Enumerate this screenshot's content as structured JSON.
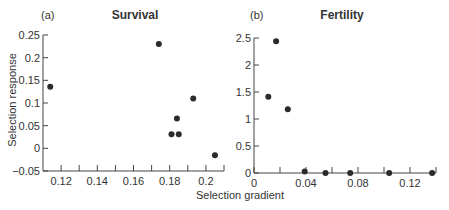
{
  "figure": {
    "ylabel": "Selection response",
    "xlabel": "Selection gradient",
    "marker_color": "#2b2b2b",
    "axis_color": "#444444"
  },
  "chart_data": [
    {
      "type": "scatter",
      "panel": "(a)",
      "title": "Survival",
      "xlabel": "Selection gradient",
      "ylabel": "Selection response",
      "xlim": [
        0.11,
        0.21
      ],
      "ylim": [
        -0.05,
        0.25
      ],
      "xticks": [
        0.12,
        0.13,
        0.14,
        0.15,
        0.16,
        0.17,
        0.18,
        0.19,
        0.2,
        0.21
      ],
      "xtick_labels": [
        "0.12",
        "",
        "0.14",
        "",
        "0.16",
        "",
        "0.18",
        "",
        "0.2",
        ""
      ],
      "yticks": [
        -0.05,
        0,
        0.05,
        0.1,
        0.15,
        0.2,
        0.25
      ],
      "ytick_labels": [
        "−0.05",
        "0",
        "0.05",
        "0.1",
        "0.15",
        "0.2",
        "0.25"
      ],
      "grid": false,
      "points": [
        {
          "x": 0.114,
          "y": 0.136
        },
        {
          "x": 0.174,
          "y": 0.23
        },
        {
          "x": 0.193,
          "y": 0.11
        },
        {
          "x": 0.184,
          "y": 0.066
        },
        {
          "x": 0.181,
          "y": 0.031
        },
        {
          "x": 0.185,
          "y": 0.031
        },
        {
          "x": 0.205,
          "y": -0.015
        }
      ]
    },
    {
      "type": "scatter",
      "panel": "(b)",
      "title": "Fertility",
      "xlabel": "Selection gradient",
      "ylabel": "Selection response",
      "xlim": [
        0,
        0.14
      ],
      "ylim": [
        0,
        2.5
      ],
      "xticks": [
        0,
        0.02,
        0.04,
        0.06,
        0.08,
        0.1,
        0.12,
        0.14
      ],
      "xtick_labels": [
        "0",
        "",
        "0.04",
        "",
        "0.08",
        "",
        "0.12",
        ""
      ],
      "yticks": [
        0,
        0.5,
        1,
        1.5,
        2,
        2.5
      ],
      "ytick_labels": [
        "0",
        "0.5",
        "1",
        "1.5",
        "2",
        "2.5"
      ],
      "grid": false,
      "points": [
        {
          "x": 0.011,
          "y": 1.41
        },
        {
          "x": 0.017,
          "y": 2.44
        },
        {
          "x": 0.026,
          "y": 1.18
        },
        {
          "x": 0.039,
          "y": 0.03
        },
        {
          "x": 0.055,
          "y": 0.0
        },
        {
          "x": 0.074,
          "y": 0.0
        },
        {
          "x": 0.104,
          "y": 0.0
        },
        {
          "x": 0.137,
          "y": 0.0
        }
      ]
    }
  ]
}
